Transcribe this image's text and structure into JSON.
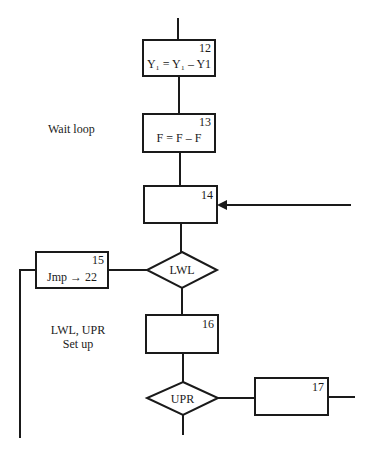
{
  "diagram": {
    "type": "flowchart",
    "nodes": [
      {
        "id": "12",
        "shape": "process",
        "number": "12",
        "text": "Y₁ = Y₁ – Y1"
      },
      {
        "id": "13",
        "shape": "process",
        "number": "13",
        "text": "F = F – F"
      },
      {
        "id": "14",
        "shape": "process",
        "number": "14",
        "text": ""
      },
      {
        "id": "lwl",
        "shape": "decision",
        "text": "LWL"
      },
      {
        "id": "15",
        "shape": "process",
        "number": "15",
        "text": "Jmp → 22"
      },
      {
        "id": "16",
        "shape": "process",
        "number": "16",
        "text": ""
      },
      {
        "id": "upr",
        "shape": "decision",
        "text": "UPR"
      },
      {
        "id": "17",
        "shape": "process",
        "number": "17",
        "text": ""
      }
    ],
    "annotations": {
      "wait_loop": "Wait loop",
      "setup_line1": "LWL, UPR",
      "setup_line2": "Set up"
    },
    "edges": [
      {
        "from": "top",
        "to": "12"
      },
      {
        "from": "12",
        "to": "13"
      },
      {
        "from": "13",
        "to": "14"
      },
      {
        "from": "right-entry",
        "to": "14",
        "arrow": true
      },
      {
        "from": "14",
        "to": "lwl"
      },
      {
        "from": "lwl",
        "to": "15"
      },
      {
        "from": "15",
        "to": "left-exit-down"
      },
      {
        "from": "lwl",
        "to": "16"
      },
      {
        "from": "16",
        "to": "upr"
      },
      {
        "from": "upr",
        "to": "17"
      },
      {
        "from": "17",
        "to": "right-exit"
      },
      {
        "from": "upr",
        "to": "bottom-exit"
      }
    ]
  }
}
